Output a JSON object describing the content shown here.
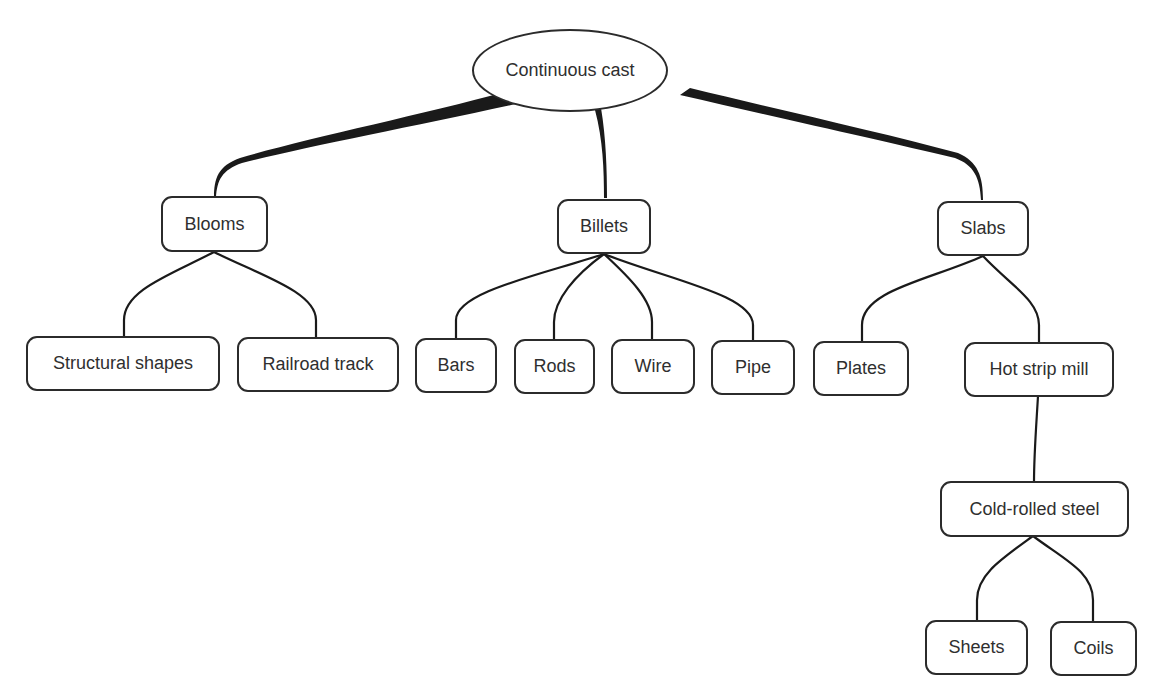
{
  "diagram": {
    "title": "Continuous cast",
    "root": {
      "label": "Continuous cast"
    },
    "level1": [
      {
        "label": "Blooms"
      },
      {
        "label": "Billets"
      },
      {
        "label": "Slabs"
      }
    ],
    "blooms_children": [
      {
        "label": "Structural shapes"
      },
      {
        "label": "Railroad track"
      }
    ],
    "billets_children": [
      {
        "label": "Bars"
      },
      {
        "label": "Rods"
      },
      {
        "label": "Wire"
      },
      {
        "label": "Pipe"
      }
    ],
    "slabs_children": [
      {
        "label": "Plates"
      },
      {
        "label": "Hot strip mill"
      }
    ],
    "hot_strip_mill_children": [
      {
        "label": "Cold-rolled steel"
      }
    ],
    "cold_rolled_children": [
      {
        "label": "Sheets"
      },
      {
        "label": "Coils"
      }
    ],
    "colors": {
      "line": "#1a1a1a",
      "border": "#2b2b2b",
      "text": "#2f2f2f",
      "background": "#ffffff"
    }
  }
}
